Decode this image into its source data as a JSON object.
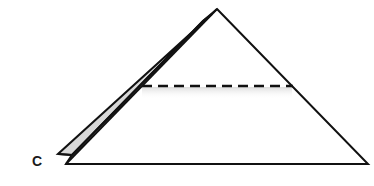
{
  "diagram": {
    "type": "folded-paper-triangle",
    "labels": [
      {
        "id": "corner-c",
        "text": "C"
      }
    ],
    "colors": {
      "stroke": "#111111",
      "flap_fill": "#d8d8d8",
      "shadow": "#e6e6e6",
      "background": "#ffffff"
    },
    "elements": {
      "main_triangle": "Large triangle with apex at top center and wide base",
      "folded_flap": "Narrow gray flap along left edge ending at corner C",
      "fold_line": "Horizontal dashed fold line across upper-middle of triangle"
    }
  }
}
